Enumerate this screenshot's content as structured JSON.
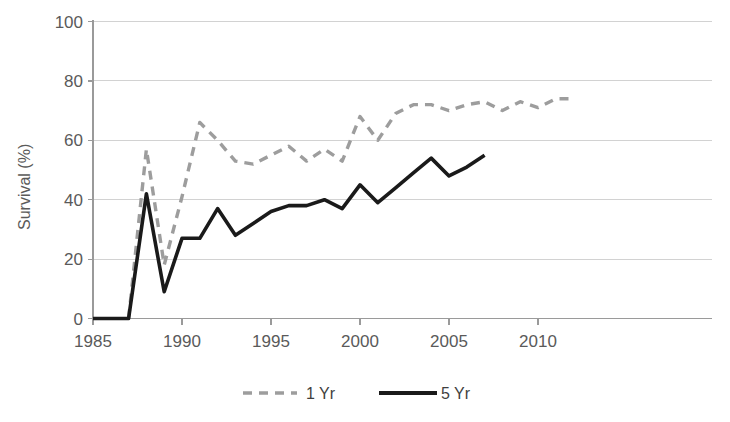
{
  "chart_data": {
    "type": "line",
    "title": "",
    "xlabel": "",
    "ylabel": "Survival (%)",
    "xlim": [
      1985,
      2012.6
    ],
    "ylim": [
      0,
      100
    ],
    "grid": true,
    "legend_position": "bottom",
    "y_ticks": [
      0,
      20,
      40,
      60,
      80,
      100
    ],
    "y_tick_labels": [
      "0",
      "20",
      "40",
      "60",
      "80",
      "100"
    ],
    "x_ticks": [
      1985,
      1990,
      1995,
      2000,
      2005,
      2010
    ],
    "x_tick_labels": [
      "1985",
      "1990",
      "1995",
      "2000",
      "2005",
      "2010"
    ],
    "series": [
      {
        "name": "1 Yr",
        "style": "dashed",
        "color": "#9d9d9d",
        "x": [
          1987,
          1988,
          1989,
          1990,
          1991,
          1992,
          1993,
          1994,
          1995,
          1996,
          1997,
          1998,
          1999,
          2000,
          2001,
          2002,
          2003,
          2004,
          2005,
          2006,
          2007,
          2008,
          2009,
          2010,
          2011,
          2012
        ],
        "values": [
          0,
          57,
          18,
          41,
          66,
          60,
          53,
          52,
          55,
          58,
          53,
          57,
          53,
          68,
          60,
          69,
          72,
          72,
          70,
          72,
          73,
          70,
          73,
          71,
          74,
          74
        ]
      },
      {
        "name": "5 Yr",
        "style": "solid",
        "color": "#1a1a1a",
        "x": [
          1985,
          1986,
          1987,
          1988,
          1989,
          1990,
          1991,
          1992,
          1993,
          1994,
          1995,
          1996,
          1997,
          1998,
          1999,
          2000,
          2001,
          2002,
          2003,
          2004,
          2005,
          2006,
          2007
        ],
        "values": [
          0,
          0,
          0,
          42,
          9,
          27,
          27,
          37,
          28,
          32,
          36,
          38,
          38,
          40,
          37,
          45,
          39,
          44,
          49,
          54,
          48,
          51,
          55
        ]
      }
    ]
  },
  "axes": {
    "y_title": "Survival (%)"
  },
  "legend": {
    "items": [
      {
        "label": "1 Yr",
        "style": "dashed",
        "color": "#9d9d9d"
      },
      {
        "label": "5 Yr",
        "style": "solid",
        "color": "#1a1a1a"
      }
    ]
  }
}
